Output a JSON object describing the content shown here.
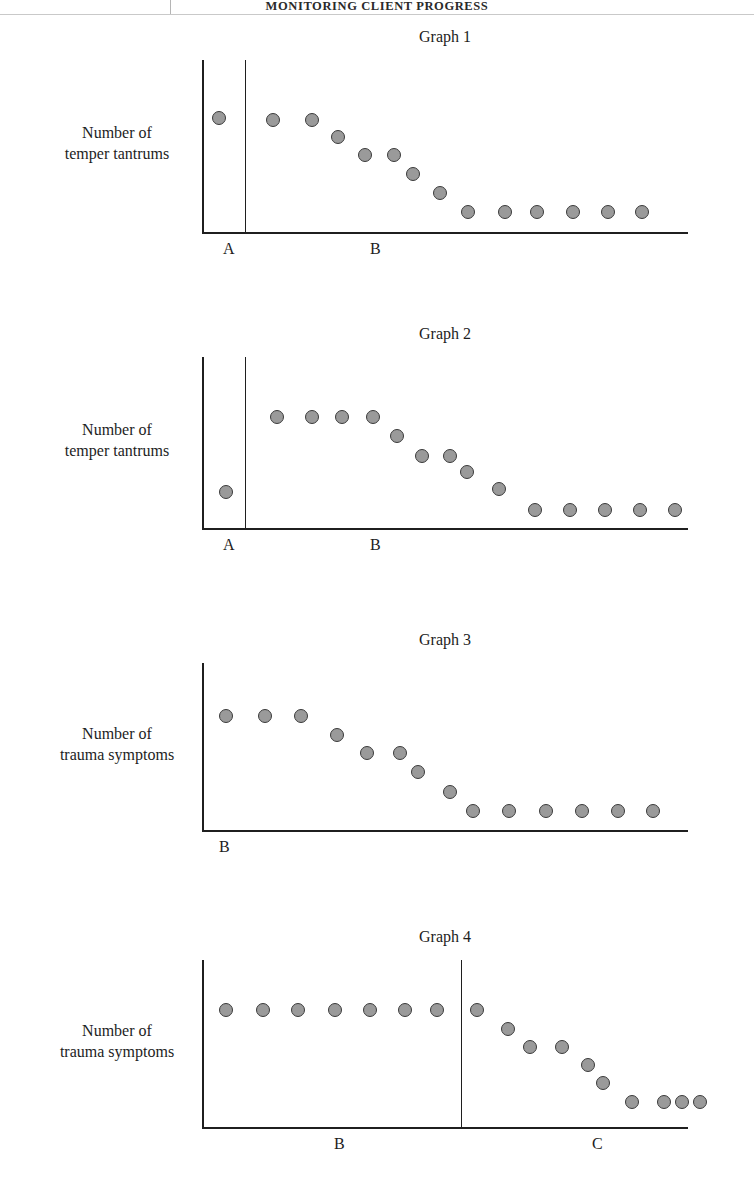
{
  "running_head": {
    "text": "MONITORING CLIENT PROGRESS"
  },
  "page": {
    "width": 754,
    "height": 1182,
    "background": "#ffffff",
    "point_fill": "#9a9a9a",
    "point_stroke": "#3a3a3a",
    "axis_color": "#1f1f1f"
  },
  "chart_data": [
    {
      "type": "scatter",
      "title": "Graph 1",
      "ylabel": "Number of\ntemper tantrums",
      "ylabel_line1": "Number of",
      "ylabel_line2": "temper tantrums",
      "xlabel": "",
      "grid": false,
      "legend": "none",
      "axis": {
        "x0": 202,
        "x1": 688,
        "ytop": 60,
        "ybase": 232
      },
      "phase_lines": [
        245
      ],
      "phase_labels": [
        {
          "text": "A",
          "x": 223,
          "y": 240
        },
        {
          "text": "B",
          "x": 370,
          "y": 240
        }
      ],
      "x": [
        219,
        273,
        312,
        338,
        365,
        394,
        413,
        440,
        468,
        505,
        537,
        573,
        608,
        642
      ],
      "y": [
        118,
        120,
        120,
        137,
        155,
        155,
        174,
        193,
        212,
        212,
        212,
        212,
        212,
        212
      ],
      "values": [
        9,
        9,
        9,
        8,
        7,
        7,
        6,
        5,
        4,
        4,
        4,
        4,
        4,
        4
      ],
      "ylim": [
        0,
        11
      ],
      "phases": [
        "A",
        "B",
        "B",
        "B",
        "B",
        "B",
        "B",
        "B",
        "B",
        "B",
        "B",
        "B",
        "B",
        "B"
      ]
    },
    {
      "type": "scatter",
      "title": "Graph 2",
      "ylabel": "Number of\ntemper tantrums",
      "ylabel_line1": "Number of",
      "ylabel_line2": "temper tantrums",
      "xlabel": "",
      "grid": false,
      "legend": "none",
      "axis": {
        "x0": 202,
        "x1": 688,
        "ytop": 357,
        "ybase": 528
      },
      "phase_lines": [
        245
      ],
      "phase_labels": [
        {
          "text": "A",
          "x": 223,
          "y": 536
        },
        {
          "text": "B",
          "x": 370,
          "y": 536
        }
      ],
      "x": [
        226,
        277,
        312,
        342,
        373,
        397,
        422,
        450,
        467,
        499,
        535,
        570,
        605,
        640,
        675
      ],
      "y": [
        492,
        417,
        417,
        417,
        417,
        436,
        456,
        456,
        472,
        489,
        510,
        510,
        510,
        510,
        510
      ],
      "values": [
        2,
        10,
        10,
        10,
        10,
        9,
        8,
        8,
        7,
        6,
        5,
        5,
        5,
        5,
        5
      ],
      "ylim": [
        0,
        12
      ],
      "phases": [
        "A",
        "B",
        "B",
        "B",
        "B",
        "B",
        "B",
        "B",
        "B",
        "B",
        "B",
        "B",
        "B",
        "B",
        "B"
      ]
    },
    {
      "type": "scatter",
      "title": "Graph 3",
      "ylabel": "Number of\ntrauma symptoms",
      "ylabel_line1": "Number of",
      "ylabel_line2": "trauma symptoms",
      "xlabel": "",
      "grid": false,
      "legend": "none",
      "axis": {
        "x0": 202,
        "x1": 688,
        "ytop": 663,
        "ybase": 830
      },
      "phase_lines": [],
      "phase_labels": [
        {
          "text": "B",
          "x": 219,
          "y": 838
        }
      ],
      "x": [
        226,
        265,
        301,
        337,
        367,
        400,
        418,
        450,
        473,
        509,
        546,
        582,
        618,
        653
      ],
      "y": [
        716,
        716,
        716,
        735,
        753,
        753,
        772,
        792,
        811,
        811,
        811,
        811,
        811,
        811
      ],
      "values": [
        9,
        9,
        9,
        8,
        7,
        7,
        6,
        5,
        4,
        4,
        4,
        4,
        4,
        4
      ],
      "ylim": [
        0,
        11
      ],
      "phases": [
        "B",
        "B",
        "B",
        "B",
        "B",
        "B",
        "B",
        "B",
        "B",
        "B",
        "B",
        "B",
        "B",
        "B"
      ]
    },
    {
      "type": "scatter",
      "title": "Graph 4",
      "ylabel": "Number of\ntrauma symptoms",
      "ylabel_line1": "Number of",
      "ylabel_line2": "trauma symptoms",
      "xlabel": "",
      "grid": false,
      "legend": "none",
      "axis": {
        "x0": 202,
        "x1": 688,
        "ytop": 960,
        "ybase": 1127
      },
      "phase_lines": [
        461
      ],
      "phase_labels": [
        {
          "text": "B",
          "x": 334,
          "y": 1135
        },
        {
          "text": "C",
          "x": 592,
          "y": 1135
        }
      ],
      "x": [
        226,
        263,
        298,
        335,
        370,
        405,
        437,
        477,
        508,
        530,
        562,
        588,
        603,
        632,
        664,
        682,
        700
      ],
      "y": [
        1010,
        1010,
        1010,
        1010,
        1010,
        1010,
        1010,
        1010,
        1029,
        1047,
        1047,
        1065,
        1083,
        1102,
        1102,
        1102,
        1102
      ],
      "values": [
        9,
        9,
        9,
        9,
        9,
        9,
        9,
        9,
        8,
        7,
        7,
        6,
        5,
        4,
        4,
        4,
        4
      ],
      "ylim": [
        0,
        11
      ],
      "phases": [
        "B",
        "B",
        "B",
        "B",
        "B",
        "B",
        "B",
        "C",
        "C",
        "C",
        "C",
        "C",
        "C",
        "C",
        "C",
        "C",
        "C"
      ]
    }
  ]
}
